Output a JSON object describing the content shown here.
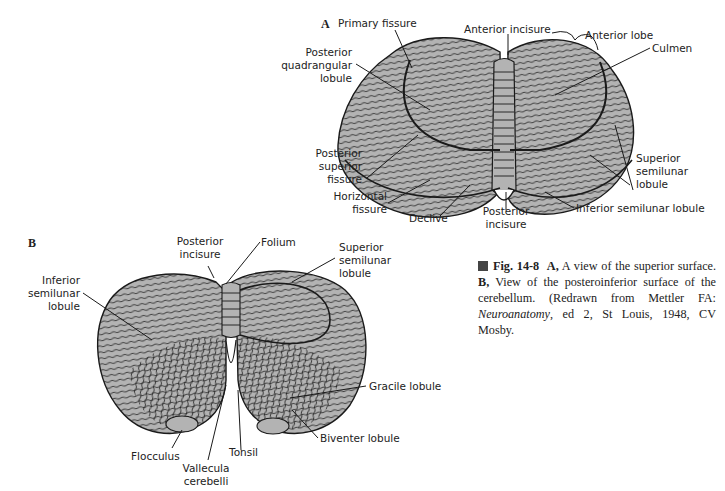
{
  "figure": {
    "number": "Fig. 14-8",
    "panel_a": {
      "letter": "A",
      "title_label": "Primary fissure",
      "labels": {
        "primary_fissure": "Primary fissure",
        "anterior_incisure": "Anterior incisure",
        "anterior_lobe": "Anterior lobe",
        "culmen": "Culmen",
        "posterior_quadrangular_lobule_1": "Posterior",
        "posterior_quadrangular_lobule_2": "quadrangular",
        "posterior_quadrangular_lobule_3": "lobule",
        "posterior_superior_fissure_1": "Posterior",
        "posterior_superior_fissure_2": "superior",
        "posterior_superior_fissure_3": "fissure",
        "horizontal_fissure_1": "Horizontal",
        "horizontal_fissure_2": "fissure",
        "declive": "Declive",
        "posterior_incisure_1": "Posterior",
        "posterior_incisure_2": "incisure",
        "superior_semilunar_lobule_1": "Superior",
        "superior_semilunar_lobule_2": "semilunar",
        "superior_semilunar_lobule_3": "lobule",
        "inferior_semilunar_lobule": "Inferior semilunar lobule"
      }
    },
    "panel_b": {
      "letter": "B",
      "labels": {
        "posterior_incisure_1": "Posterior",
        "posterior_incisure_2": "incisure",
        "folium": "Folium",
        "superior_semilunar_lobule_1": "Superior",
        "superior_semilunar_lobule_2": "semilunar",
        "superior_semilunar_lobule_3": "lobule",
        "inferior_semilunar_lobule_1": "Inferior",
        "inferior_semilunar_lobule_2": "semilunar",
        "inferior_semilunar_lobule_3": "lobule",
        "gracile_lobule": "Gracile lobule",
        "biventer_lobule": "Biventer lobule",
        "flocculus": "Flocculus",
        "tonsil": "Tonsil",
        "vallecula_cerebelli_1": "Vallecula",
        "vallecula_cerebelli_2": "cerebelli"
      }
    },
    "caption": {
      "fig_label": "Fig. 14-8",
      "a_label": "A,",
      "a_text": " A view of the superior surface. ",
      "b_label": "B,",
      "b_text": " View of the posteroinferior surface of the cerebellum. (Redrawn from Mettler FA: ",
      "book_title": "Neuroanatomy",
      "citation_tail": ", ed 2, St Louis, 1948, CV Mosby."
    },
    "colors": {
      "tissue_fill": "#b3b3b3",
      "outline": "#1a1a1a",
      "caption_marker": "#444444"
    }
  }
}
